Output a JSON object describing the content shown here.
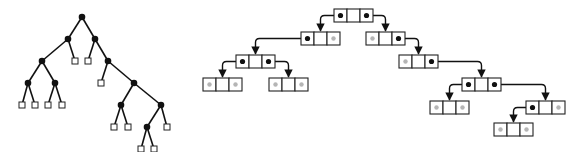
{
  "figure": {
    "width": 586,
    "height": 152,
    "colors": {
      "ink": "#111111",
      "null_dot": "#b5b5b5",
      "background": "#ffffff"
    }
  },
  "left_tree": {
    "description": "binary tree with filled internal nodes and hollow square external nodes",
    "internal_nodes": [
      {
        "id": "n0",
        "x": 82,
        "y": 17
      },
      {
        "id": "n1",
        "x": 68,
        "y": 39
      },
      {
        "id": "n2",
        "x": 95,
        "y": 39
      },
      {
        "id": "n3",
        "x": 42,
        "y": 61
      },
      {
        "id": "n4",
        "x": 108,
        "y": 61
      },
      {
        "id": "n5",
        "x": 28,
        "y": 83
      },
      {
        "id": "n6",
        "x": 55,
        "y": 83
      },
      {
        "id": "n7",
        "x": 134,
        "y": 83
      },
      {
        "id": "n8",
        "x": 121,
        "y": 105
      },
      {
        "id": "n9",
        "x": 161,
        "y": 105
      },
      {
        "id": "n10",
        "x": 147,
        "y": 127
      }
    ],
    "external_nodes": [
      {
        "id": "e0",
        "x": 75,
        "y": 61,
        "parent": "n1"
      },
      {
        "id": "e1",
        "x": 88,
        "y": 61,
        "parent": "n2"
      },
      {
        "id": "e2",
        "x": 101,
        "y": 83,
        "parent": "n4"
      },
      {
        "id": "e3",
        "x": 22,
        "y": 105,
        "parent": "n5"
      },
      {
        "id": "e4",
        "x": 35,
        "y": 105,
        "parent": "n5"
      },
      {
        "id": "e5",
        "x": 48,
        "y": 105,
        "parent": "n6"
      },
      {
        "id": "e6",
        "x": 62,
        "y": 105,
        "parent": "n6"
      },
      {
        "id": "e7",
        "x": 114,
        "y": 127,
        "parent": "n8"
      },
      {
        "id": "e8",
        "x": 128,
        "y": 127,
        "parent": "n8"
      },
      {
        "id": "e9",
        "x": 167,
        "y": 127,
        "parent": "n9"
      },
      {
        "id": "e10",
        "x": 141,
        "y": 149,
        "parent": "n10"
      },
      {
        "id": "e11",
        "x": 154,
        "y": 149,
        "parent": "n10"
      }
    ],
    "edges": [
      [
        "n0",
        "n1"
      ],
      [
        "n0",
        "n2"
      ],
      [
        "n1",
        "n3"
      ],
      [
        "n1",
        "e0"
      ],
      [
        "n2",
        "e1"
      ],
      [
        "n2",
        "n4"
      ],
      [
        "n3",
        "n5"
      ],
      [
        "n3",
        "n6"
      ],
      [
        "n4",
        "e2"
      ],
      [
        "n4",
        "n7"
      ],
      [
        "n5",
        "e3"
      ],
      [
        "n5",
        "e4"
      ],
      [
        "n6",
        "e5"
      ],
      [
        "n6",
        "e6"
      ],
      [
        "n7",
        "n8"
      ],
      [
        "n7",
        "n9"
      ],
      [
        "n8",
        "e7"
      ],
      [
        "n8",
        "e8"
      ],
      [
        "n9",
        "n10"
      ],
      [
        "n9",
        "e9"
      ],
      [
        "n10",
        "e10"
      ],
      [
        "n10",
        "e11"
      ]
    ]
  },
  "right_tree": {
    "description": "linked representation: each node is a 3-cell record (left pointer, key, right pointer); grey dot = null pointer",
    "nodes": [
      {
        "id": "r0",
        "x": 334,
        "y": 9,
        "left": "ptr",
        "right": "ptr"
      },
      {
        "id": "r1",
        "x": 301,
        "y": 32,
        "left": "ptr",
        "right": "null"
      },
      {
        "id": "r2",
        "x": 366,
        "y": 32,
        "left": "null",
        "right": "ptr"
      },
      {
        "id": "r3",
        "x": 236,
        "y": 55,
        "left": "ptr",
        "right": "ptr"
      },
      {
        "id": "r4",
        "x": 399,
        "y": 55,
        "left": "null",
        "right": "ptr"
      },
      {
        "id": "r5",
        "x": 203,
        "y": 78,
        "left": "null",
        "right": "null"
      },
      {
        "id": "r6",
        "x": 269,
        "y": 78,
        "left": "null",
        "right": "null"
      },
      {
        "id": "r7",
        "x": 462,
        "y": 78,
        "left": "ptr",
        "right": "ptr"
      },
      {
        "id": "r8",
        "x": 430,
        "y": 101,
        "left": "null",
        "right": "null"
      },
      {
        "id": "r9",
        "x": 526,
        "y": 101,
        "left": "ptr",
        "right": "null"
      },
      {
        "id": "r10",
        "x": 494,
        "y": 123,
        "left": "null",
        "right": "null"
      }
    ],
    "links": [
      {
        "from": "r0",
        "side": "left",
        "to": "r1"
      },
      {
        "from": "r0",
        "side": "right",
        "to": "r2"
      },
      {
        "from": "r1",
        "side": "left",
        "to": "r3"
      },
      {
        "from": "r2",
        "side": "right",
        "to": "r4"
      },
      {
        "from": "r3",
        "side": "left",
        "to": "r5"
      },
      {
        "from": "r3",
        "side": "right",
        "to": "r6"
      },
      {
        "from": "r4",
        "side": "right",
        "to": "r7"
      },
      {
        "from": "r7",
        "side": "left",
        "to": "r8"
      },
      {
        "from": "r7",
        "side": "right",
        "to": "r9"
      },
      {
        "from": "r9",
        "side": "left",
        "to": "r10"
      }
    ],
    "cell_width": 13,
    "cell_height": 13
  }
}
